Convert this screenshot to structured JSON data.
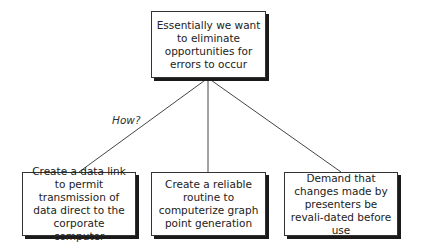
{
  "diagram": {
    "root": {
      "text": "Essentially we want to eliminate opportunities for errors to occur"
    },
    "edge_label": "How?",
    "children": [
      {
        "text": "Create a data link to permit transmission of data direct to the corporate computer"
      },
      {
        "text": "Create a reliable routine to computerize graph point generation"
      },
      {
        "text": "Demand that changes made by presenters be revali-dated before use"
      }
    ]
  }
}
